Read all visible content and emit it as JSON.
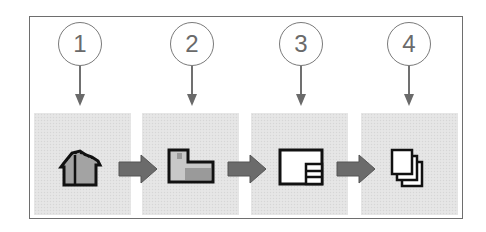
{
  "diagram": {
    "colors": {
      "frame": "#6e6e6e",
      "panel": "#e4e4e4",
      "callout": "#7a7a7a",
      "icon_outline": "#111111",
      "icon_fill": "#9a9a9a",
      "flow_arrow": "#6b6b6b"
    },
    "steps": [
      {
        "number": "1",
        "icon": "house-model-icon"
      },
      {
        "number": "2",
        "icon": "l-shaped-part-icon"
      },
      {
        "number": "3",
        "icon": "drawing-sheet-icon"
      },
      {
        "number": "4",
        "icon": "stacked-pages-icon"
      }
    ],
    "connectors": [
      "flow-arrow-1-2",
      "flow-arrow-2-3",
      "flow-arrow-3-4"
    ]
  }
}
